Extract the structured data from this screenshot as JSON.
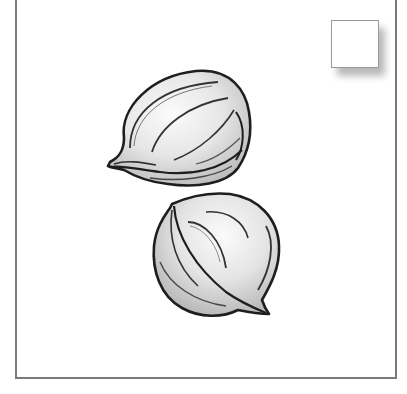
{
  "illustration": {
    "subject": "two seeds",
    "style": "grayscale line drawing",
    "colors": {
      "outline": "#222222",
      "fill_light": "#f4f4f4",
      "fill_shade": "#c8c8c8",
      "frame": "#7a7a7a",
      "background": "#ffffff"
    },
    "items": [
      {
        "name": "seed-oval-upper"
      },
      {
        "name": "seed-round-lower"
      }
    ]
  },
  "corner_box": {
    "label": ""
  }
}
